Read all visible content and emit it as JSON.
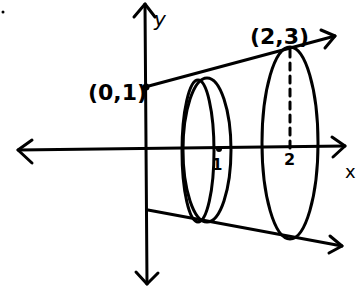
{
  "diagram": {
    "axes": {
      "x_label": "x",
      "y_label": "y"
    },
    "points": {
      "start_label": "(0,1)",
      "end_label": "(2,3)"
    },
    "ticks": {
      "tick_1": "1",
      "tick_2": "2"
    },
    "colors": {
      "ink": "#000000",
      "background": "#ffffff"
    }
  }
}
